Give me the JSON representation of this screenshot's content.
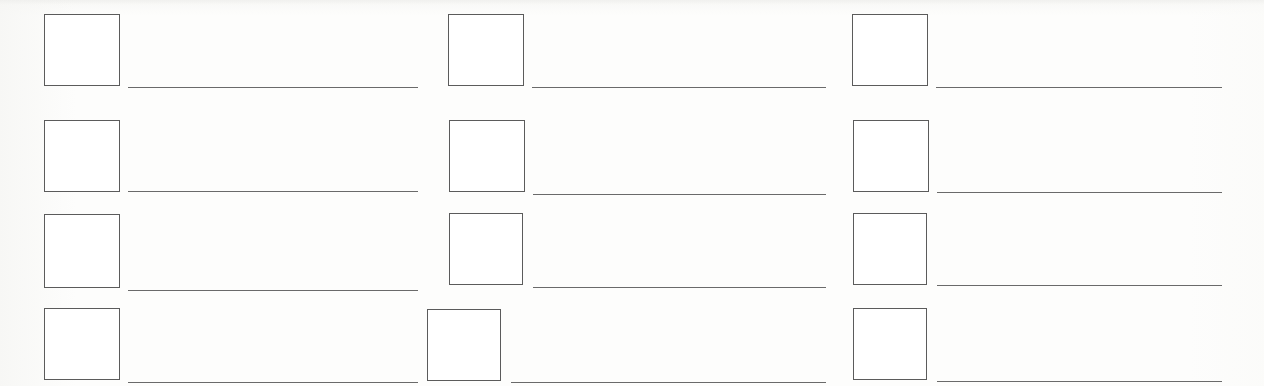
{
  "document": {
    "kind": "blank-scanned-form",
    "title": "",
    "page_width": 1264,
    "page_height": 386,
    "background_color": "#fdfdfc",
    "ink_color": "#5b5b5b",
    "rule_color": "#6a6a6a",
    "columns": 3,
    "rows": 4,
    "entry_count": 12
  },
  "entries": [
    {
      "id": "entry-r1c1",
      "column": 1,
      "row": 1,
      "checkbox_label": "",
      "checkbox_state": "unchecked",
      "writein_value": "",
      "checkbox": {
        "x": 44,
        "y": 14,
        "w": 76,
        "h": 72
      },
      "line": {
        "x": 128,
        "y": 87,
        "w": 290
      }
    },
    {
      "id": "entry-r1c2",
      "column": 2,
      "row": 1,
      "checkbox_label": "",
      "checkbox_state": "unchecked",
      "writein_value": "",
      "checkbox": {
        "x": 448,
        "y": 14,
        "w": 76,
        "h": 72
      },
      "line": {
        "x": 532,
        "y": 87,
        "w": 294
      }
    },
    {
      "id": "entry-r1c3",
      "column": 3,
      "row": 1,
      "checkbox_label": "",
      "checkbox_state": "unchecked",
      "writein_value": "",
      "checkbox": {
        "x": 852,
        "y": 14,
        "w": 76,
        "h": 72
      },
      "line": {
        "x": 936,
        "y": 87,
        "w": 286
      }
    },
    {
      "id": "entry-r2c1",
      "column": 1,
      "row": 2,
      "checkbox_label": "",
      "checkbox_state": "unchecked",
      "writein_value": "",
      "checkbox": {
        "x": 44,
        "y": 120,
        "w": 76,
        "h": 72
      },
      "line": {
        "x": 128,
        "y": 191,
        "w": 290
      }
    },
    {
      "id": "entry-r2c2",
      "column": 2,
      "row": 2,
      "checkbox_label": "",
      "checkbox_state": "unchecked",
      "writein_value": "",
      "checkbox": {
        "x": 449,
        "y": 120,
        "w": 76,
        "h": 72
      },
      "line": {
        "x": 533,
        "y": 194,
        "w": 293
      }
    },
    {
      "id": "entry-r2c3",
      "column": 3,
      "row": 2,
      "checkbox_label": "",
      "checkbox_state": "unchecked",
      "writein_value": "",
      "checkbox": {
        "x": 853,
        "y": 120,
        "w": 76,
        "h": 72
      },
      "line": {
        "x": 937,
        "y": 192,
        "w": 285
      }
    },
    {
      "id": "entry-r3c1",
      "column": 1,
      "row": 3,
      "checkbox_label": "",
      "checkbox_state": "unchecked",
      "writein_value": "",
      "checkbox": {
        "x": 44,
        "y": 214,
        "w": 76,
        "h": 74
      },
      "line": {
        "x": 128,
        "y": 290,
        "w": 290
      }
    },
    {
      "id": "entry-r3c2",
      "column": 2,
      "row": 3,
      "checkbox_label": "",
      "checkbox_state": "unchecked",
      "writein_value": "",
      "checkbox": {
        "x": 449,
        "y": 213,
        "w": 74,
        "h": 72
      },
      "line": {
        "x": 533,
        "y": 287,
        "w": 293
      }
    },
    {
      "id": "entry-r3c3",
      "column": 3,
      "row": 3,
      "checkbox_label": "",
      "checkbox_state": "unchecked",
      "writein_value": "",
      "checkbox": {
        "x": 853,
        "y": 213,
        "w": 74,
        "h": 72
      },
      "line": {
        "x": 937,
        "y": 285,
        "w": 285
      }
    },
    {
      "id": "entry-r4c1",
      "column": 1,
      "row": 4,
      "checkbox_label": "",
      "checkbox_state": "unchecked",
      "writein_value": "",
      "checkbox": {
        "x": 44,
        "y": 308,
        "w": 76,
        "h": 72
      },
      "line": {
        "x": 128,
        "y": 382,
        "w": 290
      }
    },
    {
      "id": "entry-r4c2",
      "column": 2,
      "row": 4,
      "checkbox_label": "",
      "checkbox_state": "unchecked",
      "writein_value": "",
      "checkbox": {
        "x": 427,
        "y": 309,
        "w": 74,
        "h": 72
      },
      "line": {
        "x": 511,
        "y": 382,
        "w": 315
      }
    },
    {
      "id": "entry-r4c3",
      "column": 3,
      "row": 4,
      "checkbox_label": "",
      "checkbox_state": "unchecked",
      "writein_value": "",
      "checkbox": {
        "x": 853,
        "y": 308,
        "w": 74,
        "h": 72
      },
      "line": {
        "x": 937,
        "y": 381,
        "w": 285
      }
    }
  ]
}
